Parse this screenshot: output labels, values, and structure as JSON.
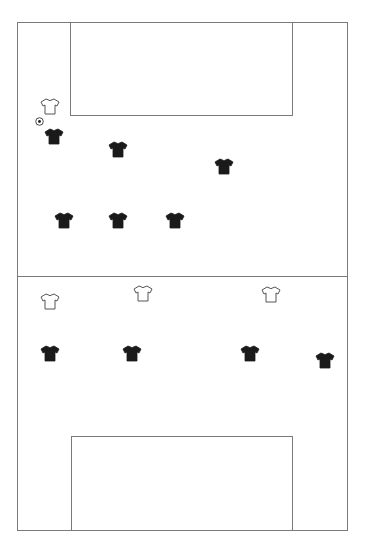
{
  "pitch": {
    "line_color": "#7a7a7a",
    "background": "#ffffff",
    "outer": {
      "x": 17,
      "y": 22,
      "w": 331,
      "h": 509
    },
    "halfway_y": 276,
    "top_box": {
      "x": 70,
      "y": 22,
      "w": 223,
      "h": 94
    },
    "bottom_box": {
      "x": 71,
      "y": 436,
      "w": 222,
      "h": 95
    }
  },
  "ball": {
    "icon": "soccer-ball-icon",
    "x": 35,
    "y": 117
  },
  "teams": {
    "dark": {
      "color": "#1a1a1a",
      "icon": "jersey-filled-icon"
    },
    "light": {
      "color": "#ffffff",
      "outline": "#555555",
      "icon": "jersey-outline-icon"
    }
  },
  "players": [
    {
      "team": "light",
      "x": 40,
      "y": 98
    },
    {
      "team": "dark",
      "x": 44,
      "y": 128
    },
    {
      "team": "dark",
      "x": 108,
      "y": 141
    },
    {
      "team": "dark",
      "x": 214,
      "y": 158
    },
    {
      "team": "dark",
      "x": 54,
      "y": 212
    },
    {
      "team": "dark",
      "x": 108,
      "y": 212
    },
    {
      "team": "dark",
      "x": 165,
      "y": 212
    },
    {
      "team": "light",
      "x": 40,
      "y": 293
    },
    {
      "team": "light",
      "x": 133,
      "y": 285
    },
    {
      "team": "light",
      "x": 261,
      "y": 286
    },
    {
      "team": "dark",
      "x": 40,
      "y": 345
    },
    {
      "team": "dark",
      "x": 122,
      "y": 345
    },
    {
      "team": "dark",
      "x": 240,
      "y": 345
    },
    {
      "team": "dark",
      "x": 315,
      "y": 352
    }
  ]
}
